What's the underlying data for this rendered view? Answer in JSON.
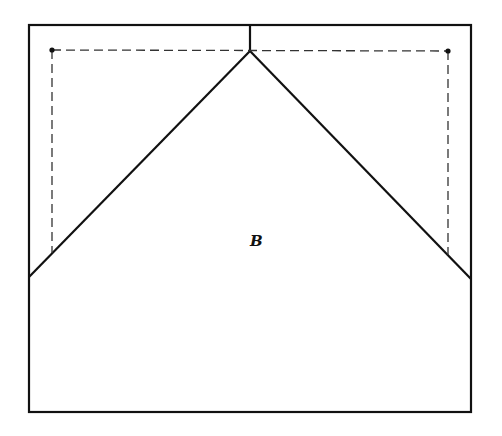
{
  "diagram": {
    "label": "B",
    "colors": {
      "stroke": "#111111",
      "background": "#ffffff"
    },
    "outer_rect": {
      "x1": 29,
      "y1": 25,
      "x2": 471,
      "y2": 412
    },
    "apex": {
      "x": 250,
      "y": 51
    },
    "center_tick": {
      "x": 250,
      "y1": 25,
      "y2": 51
    },
    "left_diagonal_end": {
      "x": 29,
      "y": 277
    },
    "right_diagonal_end": {
      "x": 471,
      "y": 279
    },
    "left_dot": {
      "x": 52,
      "y": 50
    },
    "right_dot": {
      "x": 448,
      "y": 51
    },
    "left_dashed_bottom": {
      "x": 52,
      "y": 253
    },
    "right_dashed_bottom": {
      "x": 448,
      "y": 255
    },
    "label_pos": {
      "x": 255,
      "y": 246
    }
  }
}
